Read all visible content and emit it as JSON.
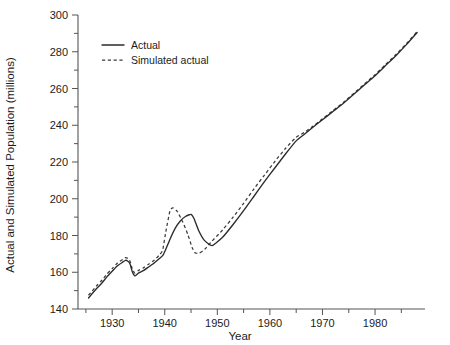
{
  "chart_data": {
    "type": "line",
    "title": "",
    "xlabel": "Year",
    "ylabel": "Actual and Simulated Population (millions)",
    "xlim": [
      1923.5,
      1989.5
    ],
    "ylim": [
      140,
      300
    ],
    "grid": false,
    "legend_position": "top-left-inside",
    "x_ticks_major": [
      1930,
      1940,
      1950,
      1960,
      1970,
      1980
    ],
    "x_tick_labels": [
      "1930",
      "1940",
      "1950",
      "1960",
      "1970",
      "1980"
    ],
    "x_ticks_minor": [
      1925,
      1935,
      1945,
      1955,
      1965,
      1975,
      1985
    ],
    "y_ticks_major": [
      140,
      160,
      180,
      200,
      220,
      240,
      260,
      280,
      300
    ],
    "y_tick_labels": [
      "140",
      "160",
      "180",
      "200",
      "220",
      "240",
      "260",
      "280",
      "300"
    ],
    "y_ticks_minor": [
      150,
      170,
      190,
      210,
      230,
      250,
      270,
      290
    ],
    "series": [
      {
        "name": "Actual",
        "style": "solid",
        "color": "#2b2b2b",
        "x": [
          1925.5,
          1927,
          1928,
          1929,
          1930,
          1931,
          1932,
          1932.5,
          1933,
          1933.4,
          1933.8,
          1934.3,
          1935,
          1936,
          1937,
          1938,
          1939,
          1939.6,
          1940.2,
          1941,
          1942,
          1943,
          1944,
          1945,
          1945.6,
          1946.4,
          1947.5,
          1949,
          1951,
          1953,
          1955,
          1957,
          1959,
          1961,
          1963,
          1965,
          1966.5,
          1968,
          1970,
          1972,
          1974,
          1976,
          1978,
          1980,
          1982,
          1984,
          1986,
          1988
        ],
        "y": [
          146.0,
          151.0,
          154.0,
          157.5,
          160.5,
          163.5,
          165.5,
          166.5,
          166.0,
          164.5,
          160.5,
          158.0,
          159.5,
          161.0,
          163.0,
          165.0,
          167.5,
          169.0,
          172.5,
          178.0,
          184.0,
          188.0,
          190.5,
          191.5,
          189.0,
          183.0,
          177.5,
          174.5,
          179.0,
          186.0,
          193.5,
          201.5,
          209.5,
          217.0,
          224.5,
          231.5,
          235.0,
          238.5,
          243.0,
          247.5,
          252.0,
          257.0,
          262.0,
          267.0,
          272.5,
          278.0,
          284.0,
          290.5
        ]
      },
      {
        "name": "Simulated actual",
        "style": "dashed",
        "color": "#3a3a3a",
        "x": [
          1925.5,
          1927,
          1928,
          1929,
          1930,
          1931,
          1932,
          1932.5,
          1933,
          1933.4,
          1933.8,
          1934.3,
          1935,
          1936,
          1937,
          1938,
          1939,
          1939.6,
          1940.2,
          1941,
          1941.6,
          1942.4,
          1943.4,
          1944.4,
          1945.2,
          1945.8,
          1946.6,
          1947.6,
          1949,
          1951,
          1953,
          1955,
          1957,
          1959,
          1961,
          1963,
          1965,
          1966.5,
          1968,
          1970,
          1972,
          1974,
          1976,
          1978,
          1980,
          1982,
          1984,
          1986,
          1988
        ],
        "y": [
          147.5,
          152.5,
          155.5,
          159.0,
          162.0,
          165.0,
          167.0,
          168.0,
          167.5,
          166.0,
          162.0,
          159.5,
          161.0,
          162.5,
          164.5,
          166.5,
          169.5,
          172.0,
          182.0,
          193.5,
          195.0,
          193.0,
          187.5,
          180.5,
          173.5,
          170.5,
          170.5,
          172.5,
          177.0,
          183.0,
          190.0,
          197.5,
          205.5,
          213.0,
          220.5,
          227.5,
          233.5,
          236.0,
          239.0,
          243.5,
          248.0,
          252.5,
          257.5,
          262.5,
          267.5,
          273.0,
          278.5,
          284.5,
          291.0
        ]
      }
    ],
    "legend": [
      {
        "label": "Actual",
        "style": "solid"
      },
      {
        "label": "Simulated actual",
        "style": "dashed"
      }
    ]
  }
}
